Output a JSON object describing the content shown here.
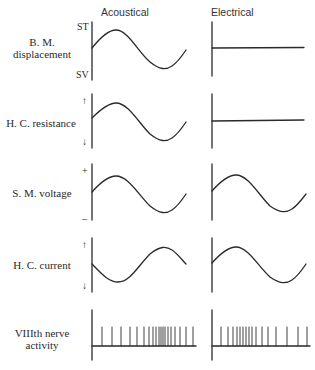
{
  "columns": {
    "acoustical": "Acoustical",
    "electrical": "Electrical"
  },
  "rows": [
    {
      "label_line1": "B. M.",
      "label_line2": "displacement",
      "top_tick": "ST",
      "bottom_tick": "SV",
      "electrical_trace": "flat"
    },
    {
      "label": "H. C. resistance",
      "top_tick": "↑",
      "bottom_tick": "↓",
      "electrical_trace": "flat"
    },
    {
      "label": "S. M. voltage",
      "top_tick": "+",
      "bottom_tick": "–",
      "electrical_trace": "sine"
    },
    {
      "label": "H. C. current",
      "top_tick": "↑",
      "bottom_tick": "↓",
      "electrical_trace": "sine"
    },
    {
      "label_line1": "VIIIth nerve",
      "label_line2": "activity",
      "electrical_trace": "spikes"
    }
  ],
  "acoustical_spike_x": [
    102,
    112,
    121,
    130,
    137,
    144,
    149,
    153,
    156,
    159,
    161,
    163,
    165,
    168,
    171,
    175,
    180,
    186,
    193
  ],
  "electrical_spike_x": [
    221,
    228,
    233,
    237,
    240,
    243,
    246,
    249,
    252,
    256,
    262,
    268,
    276,
    287,
    298,
    307
  ],
  "colors": {
    "ink": "#2a2a2a",
    "background": "#ffffff"
  }
}
